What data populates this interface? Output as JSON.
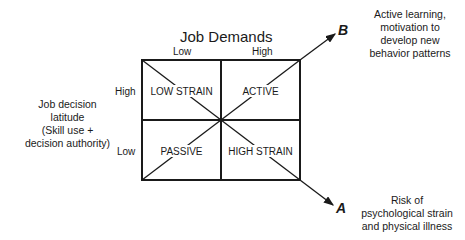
{
  "diagram": {
    "title": "Job Demands",
    "x_axis": {
      "low_label": "Low",
      "high_label": "High"
    },
    "y_axis": {
      "title": "Job decision latitude (Skill use + decision authority)",
      "title_lines": [
        "Job decision",
        "latitude",
        "(Skill use +",
        "decision authority)"
      ],
      "high_label": "High",
      "low_label": "Low"
    },
    "quadrants": {
      "top_left": "LOW STRAIN",
      "top_right": "ACTIVE",
      "bottom_left": "PASSIVE",
      "bottom_right": "HIGH STRAIN"
    },
    "arrows": {
      "b": {
        "label": "B",
        "description_lines": [
          "Active learning,",
          "motivation to",
          "develop new",
          "behavior patterns"
        ]
      },
      "a": {
        "label": "A",
        "description_lines": [
          "Risk of",
          "psychological strain",
          "and physical illness"
        ]
      }
    },
    "colors": {
      "line": "#1a1a1a",
      "background": "#ffffff"
    }
  }
}
